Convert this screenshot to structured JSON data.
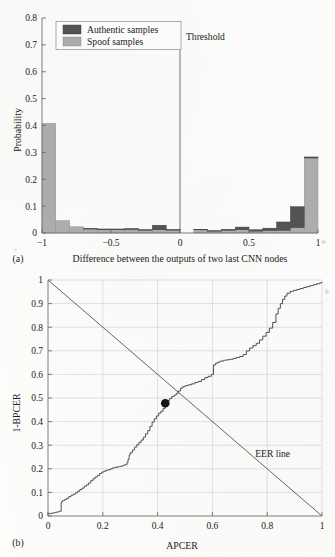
{
  "figure": {
    "panel_a_label": "(a)",
    "panel_b_label": "(b)"
  },
  "chart_data": [
    {
      "id": "panel-a",
      "type": "bar",
      "title": "",
      "xlabel": "Difference between the outputs of two last CNN nodes",
      "ylabel": "Probability",
      "xlim": [
        -1,
        1
      ],
      "ylim": [
        0,
        0.8
      ],
      "grid": false,
      "legend_position": "upper-left",
      "xticks": [
        "-1",
        "-0.5",
        "0",
        "0.5",
        "1"
      ],
      "xtick_values": [
        -1,
        -0.5,
        0,
        0.5,
        1
      ],
      "yticks": [
        "0",
        "0.1",
        "0.2",
        "0.3",
        "0.4",
        "0.5",
        "0.6",
        "0.7",
        "0.8"
      ],
      "ytick_values": [
        0,
        0.1,
        0.2,
        0.3,
        0.4,
        0.5,
        0.6,
        0.7,
        0.8
      ],
      "annotations": [
        {
          "text": "Threshold",
          "x": 0.0,
          "y": 0.72
        }
      ],
      "bin_edges": [
        -1.0,
        -0.9,
        -0.8,
        -0.7,
        -0.6,
        -0.5,
        -0.4,
        -0.3,
        -0.2,
        -0.1,
        0.0,
        0.1,
        0.2,
        0.3,
        0.4,
        0.5,
        0.6,
        0.7,
        0.8,
        0.9,
        1.0
      ],
      "series": [
        {
          "name": "Spoof samples",
          "color": "#aeaeae",
          "values": [
            0.408,
            0.046,
            0.023,
            0.015,
            0.012,
            0.012,
            0.013,
            0.01,
            0.012,
            0.011,
            0.0,
            0.012,
            0.007,
            0.01,
            0.012,
            0.007,
            0.009,
            0.01,
            0.02,
            0.279
          ]
        },
        {
          "name": "Authentic samples",
          "color": "#545454",
          "values": [
            0.0,
            0.0,
            0.0,
            0.002,
            0.003,
            0.003,
            0.004,
            0.003,
            0.017,
            0.002,
            0.0,
            0.002,
            0.002,
            0.004,
            0.01,
            0.005,
            0.009,
            0.031,
            0.078,
            0.004
          ]
        }
      ]
    },
    {
      "id": "panel-b",
      "type": "line",
      "title": "",
      "xlabel": "APCER",
      "ylabel": "1-BPCER",
      "xlim": [
        0,
        1
      ],
      "ylim": [
        0,
        1
      ],
      "grid": true,
      "legend_position": "none",
      "xticks": [
        "0",
        "0.2",
        "0.4",
        "0.6",
        "0.8",
        "1"
      ],
      "xtick_values": [
        0,
        0.2,
        0.4,
        0.6,
        0.8,
        1
      ],
      "yticks": [
        "0",
        "0.1",
        "0.2",
        "0.3",
        "0.4",
        "0.5",
        "0.6",
        "0.7",
        "0.8",
        "0.9",
        "1"
      ],
      "ytick_values": [
        0,
        0.1,
        0.2,
        0.3,
        0.4,
        0.5,
        0.6,
        0.7,
        0.8,
        0.9,
        1
      ],
      "annotations": [
        {
          "text": "EER line",
          "x": 0.82,
          "y": 0.25
        }
      ],
      "eer_line": {
        "from": [
          0,
          1
        ],
        "to": [
          1,
          0
        ]
      },
      "eer_point": {
        "x": 0.428,
        "y": 0.478
      },
      "series": [
        {
          "name": "DET curve",
          "x": [
            0.0,
            0.012,
            0.02,
            0.028,
            0.036,
            0.042,
            0.048,
            0.05,
            0.052,
            0.06,
            0.068,
            0.076,
            0.084,
            0.092,
            0.1,
            0.108,
            0.116,
            0.124,
            0.132,
            0.14,
            0.148,
            0.156,
            0.164,
            0.172,
            0.18,
            0.188,
            0.196,
            0.204,
            0.212,
            0.22,
            0.228,
            0.236,
            0.244,
            0.252,
            0.26,
            0.268,
            0.276,
            0.284,
            0.288,
            0.292,
            0.296,
            0.3,
            0.308,
            0.316,
            0.324,
            0.332,
            0.34,
            0.348,
            0.356,
            0.364,
            0.372,
            0.38,
            0.388,
            0.396,
            0.404,
            0.412,
            0.42,
            0.428,
            0.436,
            0.444,
            0.452,
            0.46,
            0.468,
            0.476,
            0.484,
            0.492,
            0.5,
            0.512,
            0.524,
            0.536,
            0.548,
            0.56,
            0.572,
            0.584,
            0.596,
            0.604,
            0.612,
            0.62,
            0.628,
            0.64,
            0.652,
            0.664,
            0.676,
            0.688,
            0.7,
            0.712,
            0.724,
            0.736,
            0.748,
            0.76,
            0.772,
            0.784,
            0.796,
            0.808,
            0.82,
            0.832,
            0.84,
            0.848,
            0.856,
            0.864,
            0.872,
            0.884,
            0.896,
            0.908,
            0.92,
            0.932,
            0.944,
            0.956,
            0.968,
            0.98,
            0.992,
            1.0
          ],
          "y": [
            0.01,
            0.012,
            0.014,
            0.016,
            0.018,
            0.02,
            0.055,
            0.06,
            0.065,
            0.07,
            0.075,
            0.082,
            0.088,
            0.092,
            0.098,
            0.105,
            0.112,
            0.118,
            0.126,
            0.132,
            0.14,
            0.15,
            0.158,
            0.165,
            0.172,
            0.18,
            0.186,
            0.19,
            0.194,
            0.196,
            0.2,
            0.204,
            0.206,
            0.208,
            0.21,
            0.212,
            0.216,
            0.218,
            0.226,
            0.24,
            0.258,
            0.268,
            0.28,
            0.292,
            0.302,
            0.312,
            0.322,
            0.334,
            0.348,
            0.362,
            0.38,
            0.398,
            0.412,
            0.424,
            0.436,
            0.444,
            0.456,
            0.478,
            0.49,
            0.498,
            0.506,
            0.512,
            0.52,
            0.53,
            0.542,
            0.548,
            0.552,
            0.556,
            0.56,
            0.566,
            0.57,
            0.578,
            0.586,
            0.592,
            0.6,
            0.64,
            0.648,
            0.652,
            0.656,
            0.66,
            0.662,
            0.664,
            0.668,
            0.672,
            0.676,
            0.684,
            0.7,
            0.712,
            0.722,
            0.732,
            0.746,
            0.762,
            0.778,
            0.796,
            0.82,
            0.856,
            0.88,
            0.9,
            0.918,
            0.932,
            0.944,
            0.952,
            0.956,
            0.96,
            0.964,
            0.968,
            0.972,
            0.976,
            0.98,
            0.984,
            0.988,
            0.99
          ]
        }
      ]
    }
  ],
  "panel_a": {
    "legend": [
      {
        "label": "Authentic samples",
        "swatch": "#545454"
      },
      {
        "label": "Spoof samples",
        "swatch": "#aeaeae"
      }
    ],
    "threshold_label": "Threshold",
    "ylabel": "Probability",
    "xlabel": "Difference between the outputs of two last CNN nodes"
  },
  "panel_b": {
    "eer_label": "EER line",
    "ylabel": "1-BPCER",
    "xlabel": "APCER"
  }
}
